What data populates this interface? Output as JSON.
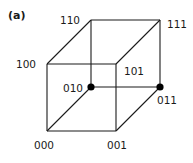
{
  "panel_label": "(a)",
  "colors": {
    "line": "#1a1a1a",
    "marker": "#000000",
    "background": "#ffffff"
  },
  "vertices": {
    "v000": {
      "label": "000",
      "x": 47,
      "y": 131
    },
    "v001": {
      "label": "001",
      "x": 116,
      "y": 131
    },
    "v100": {
      "label": "100",
      "x": 47,
      "y": 64
    },
    "v101": {
      "label": "101",
      "x": 116,
      "y": 64
    },
    "v010": {
      "label": "010",
      "x": 91,
      "y": 87,
      "marked": true
    },
    "v011": {
      "label": "011",
      "x": 160,
      "y": 87,
      "marked": true
    },
    "v110": {
      "label": "110",
      "x": 91,
      "y": 20
    },
    "v111": {
      "label": "111",
      "x": 160,
      "y": 20
    }
  },
  "edges": [
    [
      "v000",
      "v001"
    ],
    [
      "v001",
      "v101"
    ],
    [
      "v101",
      "v100"
    ],
    [
      "v100",
      "v000"
    ],
    [
      "v010",
      "v011"
    ],
    [
      "v011",
      "v111"
    ],
    [
      "v111",
      "v110"
    ],
    [
      "v110",
      "v010"
    ],
    [
      "v000",
      "v010"
    ],
    [
      "v001",
      "v011"
    ],
    [
      "v100",
      "v110"
    ],
    [
      "v101",
      "v111"
    ]
  ]
}
